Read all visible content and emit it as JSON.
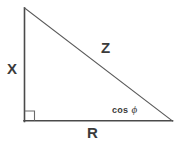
{
  "figure": {
    "type": "right-triangle-impedance-diagram",
    "background_color": "#ffffff",
    "stroke_color": "#4a4a4a",
    "text_color": "#3b3b3b",
    "labels": {
      "vertical_leg": "X",
      "hypotenuse": "Z",
      "horizontal_leg": "R",
      "angle_cos_text": "cos",
      "angle_phi_symbol": "ϕ"
    },
    "geometry": {
      "apex": [
        24,
        8
      ],
      "right_angle_vertex": [
        24,
        121
      ],
      "right_vertex": [
        172,
        121
      ],
      "right_angle_marker_size": 10
    }
  }
}
